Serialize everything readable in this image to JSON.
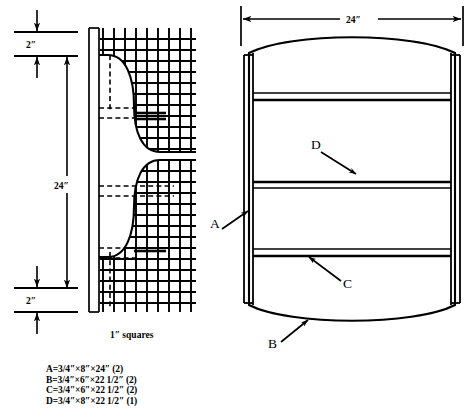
{
  "drawing": {
    "title": "Cabinet construction plan",
    "ink": "#000000",
    "paper": "#ffffff"
  },
  "left_view": {
    "name": "side profile on grid",
    "grid_caption": "1″ squares",
    "dimensions": [
      {
        "id": "top-margin",
        "label": "2″"
      },
      {
        "id": "height",
        "label": "24″"
      },
      {
        "id": "bottom-margin",
        "label": "2″"
      }
    ]
  },
  "right_view": {
    "name": "front elevation",
    "width_dimension": "24″",
    "callouts": [
      {
        "id": "A",
        "label": "A"
      },
      {
        "id": "B",
        "label": "B"
      },
      {
        "id": "C",
        "label": "C"
      },
      {
        "id": "D",
        "label": "D"
      }
    ]
  },
  "cut_list": [
    {
      "part": "A",
      "eq": "=",
      "t": "3/4″",
      "w": "8″",
      "l": "24″",
      "qty": "(2)"
    },
    {
      "part": "B",
      "eq": "=",
      "t": "3/4″",
      "w": "6″",
      "l": "22 1/2″",
      "qty": "(2)"
    },
    {
      "part": "C",
      "eq": "=",
      "t": "3/4″",
      "w": "6″",
      "l": "22 1/2″",
      "qty": "(2)"
    },
    {
      "part": "D",
      "eq": "=",
      "t": "3/4″",
      "w": "8″",
      "l": "22 1/2″",
      "qty": "(1)"
    }
  ],
  "cut_list_lines": [
    "A = 3/4″ × 8″ × 24″ (2)",
    "B = 3/4″ × 6″ × 22 1/2″ (2)",
    "C = 3/4″ × 6″ × 22 1/2″ (2)",
    "D = 3/4″ × 8″ × 22 1/2″ (1)"
  ]
}
